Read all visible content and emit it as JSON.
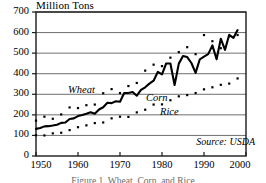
{
  "chart_data": {
    "type": "line",
    "title": "",
    "ylabel": "Million Tons",
    "xlabel": "",
    "xlim": [
      1950,
      2000
    ],
    "ylim": [
      0,
      700
    ],
    "grid": true,
    "legend_position": "inline-annotations",
    "y_ticks": [
      "700",
      "600",
      "500",
      "400",
      "300",
      "200",
      "100",
      "0"
    ],
    "y_tick_values": [
      700,
      600,
      500,
      400,
      300,
      200,
      100,
      0
    ],
    "x_ticks": [
      "1950",
      "1960",
      "1970",
      "1980",
      "1990",
      "2000"
    ],
    "x_tick_values": [
      1950,
      1960,
      1970,
      1980,
      1990,
      2000
    ],
    "source": "Source: USDA",
    "x": [
      1950,
      1951,
      1952,
      1953,
      1954,
      1955,
      1956,
      1957,
      1958,
      1959,
      1960,
      1961,
      1962,
      1963,
      1964,
      1965,
      1966,
      1967,
      1968,
      1969,
      1970,
      1971,
      1972,
      1973,
      1974,
      1975,
      1976,
      1977,
      1978,
      1979,
      1980,
      1981,
      1982,
      1983,
      1984,
      1985,
      1986,
      1987,
      1988,
      1989,
      1990,
      1991,
      1992,
      1993,
      1994,
      1995,
      1996,
      1997,
      1998
    ],
    "series": [
      {
        "name": "Wheat",
        "style": "dotted",
        "values": [
          172,
          181,
          191,
          186,
          181,
          192,
          202,
          196,
          236,
          223,
          233,
          222,
          247,
          236,
          250,
          264,
          305,
          296,
          325,
          306,
          306,
          347,
          340,
          369,
          355,
          349,
          415,
          382,
          444,
          420,
          437,
          449,
          478,
          486,
          505,
          499,
          529,
          496,
          495,
          533,
          588,
          542,
          558,
          560,
          524,
          538,
          582,
          610,
          588
        ],
        "ylim_note": "ends near 590 at 1998"
      },
      {
        "name": "Corn",
        "style": "solid",
        "values": [
          132,
          136,
          144,
          145,
          148,
          152,
          161,
          163,
          180,
          183,
          194,
          199,
          205,
          213,
          205,
          226,
          237,
          259,
          257,
          266,
          264,
          306,
          306,
          311,
          293,
          321,
          334,
          352,
          366,
          409,
          397,
          450,
          450,
          345,
          449,
          486,
          481,
          452,
          404,
          470,
          483,
          495,
          538,
          470,
          570,
          516,
          589,
          574,
          612
        ],
        "ylim_note": "ends near 615 at 1998; sharp dips at 1983, 1988, 1993"
      },
      {
        "name": "Rice",
        "style": "dotted",
        "values": [
          101,
          76,
          100,
          104,
          110,
          110,
          113,
          116,
          126,
          129,
          140,
          149,
          149,
          153,
          160,
          163,
          163,
          176,
          183,
          186,
          191,
          196,
          190,
          206,
          212,
          221,
          225,
          240,
          250,
          251,
          251,
          274,
          271,
          274,
          290,
          293,
          296,
          300,
          306,
          319,
          324,
          326,
          334,
          335,
          346,
          347,
          352,
          360,
          377
        ],
        "ylim_note": "ends near 380 at 1998"
      }
    ],
    "annotations": [
      {
        "text": "Wheat",
        "series": "Wheat"
      },
      {
        "text": "Corn",
        "series": "Corn"
      },
      {
        "text": "Rice",
        "series": "Rice"
      }
    ]
  },
  "caption": "Figure 1. Wheat, Corn, and Rice"
}
